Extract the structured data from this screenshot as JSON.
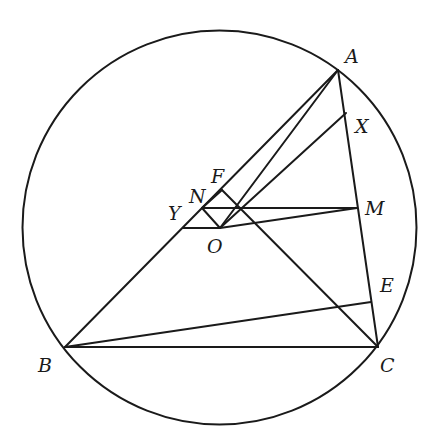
{
  "diagram": {
    "type": "geometry",
    "stroke_color": "#1a1a1a",
    "background": "#ffffff",
    "circle": {
      "cx": 219.5,
      "cy": 227.5,
      "r": 197
    },
    "points": {
      "A": {
        "x": 338,
        "y": 70
      },
      "B": {
        "x": 65,
        "y": 347
      },
      "C": {
        "x": 378,
        "y": 347
      },
      "X": {
        "x": 346,
        "y": 113
      },
      "M": {
        "x": 357,
        "y": 208
      },
      "E": {
        "x": 371,
        "y": 302
      },
      "O": {
        "x": 220,
        "y": 228
      },
      "Y": {
        "x": 183,
        "y": 228
      },
      "N": {
        "x": 202,
        "y": 208
      },
      "F": {
        "x": 222,
        "y": 190
      }
    },
    "segments": [
      [
        "A",
        "B"
      ],
      [
        "A",
        "C"
      ],
      [
        "B",
        "C"
      ],
      [
        "A",
        "O"
      ],
      [
        "O",
        "X"
      ],
      [
        "F",
        "C"
      ],
      [
        "N",
        "M"
      ],
      [
        "Y",
        "O"
      ],
      [
        "O",
        "M"
      ],
      [
        "B",
        "E"
      ],
      [
        "F",
        "N"
      ],
      [
        "N",
        "O"
      ]
    ],
    "labels": [
      {
        "text": "A",
        "x": 345,
        "y": 63
      },
      {
        "text": "B",
        "x": 38,
        "y": 372
      },
      {
        "text": "C",
        "x": 380,
        "y": 372
      },
      {
        "text": "X",
        "x": 355,
        "y": 133
      },
      {
        "text": "M",
        "x": 365,
        "y": 215
      },
      {
        "text": "E",
        "x": 380,
        "y": 292
      },
      {
        "text": "O",
        "x": 207,
        "y": 253
      },
      {
        "text": "Y",
        "x": 168,
        "y": 220
      },
      {
        "text": "N",
        "x": 189,
        "y": 203
      },
      {
        "text": "F",
        "x": 211,
        "y": 183
      }
    ]
  }
}
